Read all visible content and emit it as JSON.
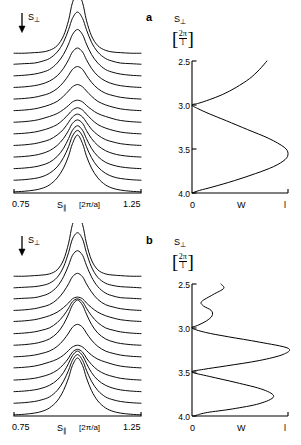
{
  "figure": {
    "background": "#ffffff",
    "line_color": "#000000"
  },
  "panels": [
    {
      "id": "a",
      "tag": "a",
      "left_plot": {
        "x_axis": {
          "label_symbol": "S",
          "label_sub": "∥",
          "unit": "[2π/a]",
          "min_label": "0.75",
          "max_label": "1.25",
          "min": 0.75,
          "max": 1.25
        },
        "stack_arrow_label": "S",
        "stack_arrow_sub": "⊥",
        "stack_arrow_dir": "down"
      },
      "right_plot": {
        "y_axis": {
          "label_symbol": "S",
          "label_sub": "⊥",
          "unit_num": "2π",
          "unit_den": "l",
          "ticks": [
            "2.5",
            "3.0",
            "3.5",
            "4.0"
          ],
          "tick_values": [
            2.5,
            3.0,
            3.5,
            4.0
          ],
          "min": 2.5,
          "max": 4.0,
          "direction": "downward"
        },
        "x_axis": {
          "label": "W",
          "ticks": [
            "0",
            "l"
          ],
          "tick_values": [
            0,
            1
          ],
          "min": 0,
          "max": 1
        }
      }
    },
    {
      "id": "b",
      "tag": "b",
      "left_plot": {
        "x_axis": {
          "label_symbol": "S",
          "label_sub": "∥",
          "unit": "[2π/a]",
          "min_label": "0.75",
          "max_label": "1.25",
          "min": 0.75,
          "max": 1.25
        },
        "stack_arrow_label": "S",
        "stack_arrow_sub": "⊥",
        "stack_arrow_dir": "down"
      },
      "right_plot": {
        "y_axis": {
          "label_symbol": "S",
          "label_sub": "⊥",
          "unit_num": "2π",
          "unit_den": "l",
          "ticks": [
            "2.5",
            "3.0",
            "3.5",
            "4.0"
          ],
          "tick_values": [
            2.5,
            3.0,
            3.5,
            4.0
          ],
          "min": 2.5,
          "max": 4.0,
          "direction": "downward"
        },
        "x_axis": {
          "label": "W",
          "ticks": [
            "0",
            "l"
          ],
          "tick_values": [
            0,
            1
          ],
          "min": 0,
          "max": 1
        }
      }
    }
  ],
  "chart_data": [
    {
      "type": "line",
      "panel": "a",
      "subplot": "left-waterfall",
      "title": "",
      "xlabel": "S∥ [2π/a]",
      "ylabel": "intensity (stacked, offset by S⊥)",
      "xlim": [
        0.75,
        1.25
      ],
      "grid": false,
      "legend": "none",
      "n_curves": 13,
      "description": "Stacked (waterfall) set of single-peaked scattering profiles, each offset vertically; S⊥ increases downward as indicated by the arrow.",
      "x": [
        0.75,
        0.79,
        0.83,
        0.86,
        0.89,
        0.92,
        0.945,
        0.965,
        0.98,
        1.0,
        1.02,
        1.035,
        1.055,
        1.08,
        1.11,
        1.14,
        1.17,
        1.21,
        1.25
      ],
      "series": [
        {
          "name": "curve-1",
          "offset": 0,
          "peak_height": 1.0,
          "values": [
            0.02,
            0.03,
            0.05,
            0.08,
            0.14,
            0.26,
            0.43,
            0.64,
            0.85,
            1.0,
            0.85,
            0.64,
            0.43,
            0.26,
            0.14,
            0.08,
            0.05,
            0.03,
            0.02
          ]
        },
        {
          "name": "curve-2",
          "offset": 1,
          "peak_height": 0.88,
          "values": [
            0.02,
            0.03,
            0.05,
            0.08,
            0.14,
            0.25,
            0.41,
            0.6,
            0.78,
            0.88,
            0.78,
            0.6,
            0.41,
            0.25,
            0.14,
            0.08,
            0.05,
            0.03,
            0.02
          ]
        },
        {
          "name": "curve-3",
          "offset": 2,
          "peak_height": 0.76,
          "values": [
            0.02,
            0.03,
            0.05,
            0.08,
            0.13,
            0.23,
            0.37,
            0.54,
            0.68,
            0.76,
            0.68,
            0.54,
            0.37,
            0.23,
            0.13,
            0.08,
            0.05,
            0.03,
            0.02
          ]
        },
        {
          "name": "curve-4",
          "offset": 3,
          "peak_height": 0.66,
          "values": [
            0.02,
            0.03,
            0.05,
            0.08,
            0.13,
            0.22,
            0.34,
            0.48,
            0.6,
            0.66,
            0.6,
            0.48,
            0.34,
            0.22,
            0.13,
            0.08,
            0.05,
            0.03,
            0.02
          ]
        },
        {
          "name": "curve-5",
          "offset": 4,
          "peak_height": 0.56,
          "values": [
            0.02,
            0.03,
            0.05,
            0.08,
            0.12,
            0.2,
            0.3,
            0.42,
            0.51,
            0.56,
            0.51,
            0.42,
            0.3,
            0.2,
            0.12,
            0.08,
            0.05,
            0.03,
            0.02
          ]
        },
        {
          "name": "curve-6",
          "offset": 5,
          "peak_height": 0.47,
          "values": [
            0.02,
            0.03,
            0.05,
            0.08,
            0.12,
            0.18,
            0.27,
            0.36,
            0.43,
            0.47,
            0.43,
            0.36,
            0.27,
            0.18,
            0.12,
            0.08,
            0.05,
            0.03,
            0.02
          ]
        },
        {
          "name": "curve-7",
          "offset": 6,
          "peak_height": 0.4,
          "values": [
            0.02,
            0.03,
            0.05,
            0.08,
            0.12,
            0.17,
            0.24,
            0.31,
            0.37,
            0.4,
            0.37,
            0.31,
            0.24,
            0.17,
            0.12,
            0.08,
            0.05,
            0.03,
            0.02
          ]
        },
        {
          "name": "curve-8",
          "offset": 7,
          "peak_height": 0.47,
          "values": [
            0.02,
            0.03,
            0.05,
            0.08,
            0.12,
            0.18,
            0.27,
            0.36,
            0.43,
            0.47,
            0.43,
            0.36,
            0.27,
            0.18,
            0.12,
            0.08,
            0.05,
            0.03,
            0.02
          ]
        },
        {
          "name": "curve-9",
          "offset": 8,
          "peak_height": 0.58,
          "values": [
            0.02,
            0.03,
            0.05,
            0.08,
            0.12,
            0.2,
            0.31,
            0.43,
            0.53,
            0.58,
            0.53,
            0.43,
            0.31,
            0.2,
            0.12,
            0.08,
            0.05,
            0.03,
            0.02
          ]
        },
        {
          "name": "curve-10",
          "offset": 9,
          "peak_height": 0.7,
          "values": [
            0.02,
            0.03,
            0.05,
            0.08,
            0.13,
            0.22,
            0.35,
            0.5,
            0.63,
            0.7,
            0.63,
            0.5,
            0.35,
            0.22,
            0.13,
            0.08,
            0.05,
            0.03,
            0.02
          ]
        },
        {
          "name": "curve-11",
          "offset": 10,
          "peak_height": 0.82,
          "values": [
            0.02,
            0.03,
            0.05,
            0.08,
            0.13,
            0.24,
            0.39,
            0.57,
            0.73,
            0.82,
            0.73,
            0.57,
            0.39,
            0.24,
            0.13,
            0.08,
            0.05,
            0.03,
            0.02
          ]
        },
        {
          "name": "curve-12",
          "offset": 11,
          "peak_height": 0.92,
          "values": [
            0.02,
            0.03,
            0.04,
            0.07,
            0.12,
            0.23,
            0.4,
            0.62,
            0.81,
            0.92,
            0.81,
            0.62,
            0.4,
            0.23,
            0.12,
            0.07,
            0.04,
            0.03,
            0.02
          ]
        },
        {
          "name": "curve-13",
          "offset": 12,
          "peak_height": 1.05,
          "values": [
            0.01,
            0.01,
            0.02,
            0.03,
            0.06,
            0.14,
            0.31,
            0.58,
            0.88,
            1.05,
            0.88,
            0.58,
            0.31,
            0.14,
            0.06,
            0.03,
            0.02,
            0.01,
            0.01
          ]
        }
      ]
    },
    {
      "type": "line",
      "panel": "a",
      "subplot": "right-W",
      "title": "",
      "xlabel": "W",
      "ylabel": "S⊥ [2π/l]",
      "xlim": [
        0,
        1
      ],
      "ylim": [
        2.5,
        4.0
      ],
      "y_inverted": true,
      "grid": false,
      "legend": "none",
      "description": "Single continuous W(S⊥) curve: enters at top right near W≈0.78 at S⊥=2.5, decreases to W=0 at S⊥=3.0, rises to a broad maximum W≈1.0 near S⊥=3.55, then falls back to W=0 at S⊥=4.0.",
      "y": [
        2.5,
        2.6,
        2.7,
        2.8,
        2.88,
        2.94,
        2.98,
        3.0,
        3.04,
        3.1,
        3.18,
        3.28,
        3.38,
        3.48,
        3.55,
        3.62,
        3.7,
        3.78,
        3.86,
        3.93,
        3.97,
        4.0
      ],
      "values": [
        0.78,
        0.7,
        0.6,
        0.46,
        0.32,
        0.18,
        0.07,
        0.0,
        0.06,
        0.18,
        0.36,
        0.58,
        0.8,
        0.96,
        1.0,
        0.97,
        0.85,
        0.66,
        0.44,
        0.22,
        0.08,
        0.0
      ]
    },
    {
      "type": "line",
      "panel": "b",
      "subplot": "left-waterfall",
      "title": "",
      "xlabel": "S∥ [2π/a]",
      "ylabel": "intensity (stacked, offset by S⊥)",
      "xlim": [
        0.75,
        1.25
      ],
      "grid": false,
      "legend": "none",
      "n_curves": 13,
      "description": "Stacked waterfall of peaks with modulated heights: large peak at top, dip, second maximum in the middle, dip, third maximum near the bottom.",
      "x": [
        0.75,
        0.79,
        0.83,
        0.86,
        0.89,
        0.92,
        0.945,
        0.965,
        0.98,
        1.0,
        1.02,
        1.035,
        1.055,
        1.08,
        1.11,
        1.14,
        1.17,
        1.21,
        1.25
      ],
      "series": [
        {
          "name": "curve-1",
          "offset": 0,
          "peak_height": 1.0,
          "values": [
            0.02,
            0.03,
            0.05,
            0.08,
            0.14,
            0.26,
            0.44,
            0.66,
            0.87,
            1.0,
            0.87,
            0.66,
            0.44,
            0.26,
            0.14,
            0.08,
            0.05,
            0.03,
            0.02
          ]
        },
        {
          "name": "curve-2",
          "offset": 1,
          "peak_height": 0.86,
          "values": [
            0.02,
            0.03,
            0.05,
            0.08,
            0.13,
            0.24,
            0.4,
            0.59,
            0.76,
            0.86,
            0.76,
            0.59,
            0.4,
            0.24,
            0.13,
            0.08,
            0.05,
            0.03,
            0.02
          ]
        },
        {
          "name": "curve-3",
          "offset": 2,
          "peak_height": 0.72,
          "values": [
            0.02,
            0.03,
            0.05,
            0.08,
            0.13,
            0.22,
            0.35,
            0.51,
            0.64,
            0.72,
            0.64,
            0.51,
            0.35,
            0.22,
            0.13,
            0.08,
            0.05,
            0.03,
            0.02
          ]
        },
        {
          "name": "curve-4",
          "offset": 3,
          "peak_height": 0.55,
          "values": [
            0.02,
            0.03,
            0.05,
            0.08,
            0.12,
            0.19,
            0.29,
            0.4,
            0.5,
            0.55,
            0.5,
            0.4,
            0.29,
            0.19,
            0.12,
            0.08,
            0.05,
            0.03,
            0.02
          ]
        },
        {
          "name": "curve-5",
          "offset": 4,
          "peak_height": 0.42,
          "values": [
            0.03,
            0.04,
            0.06,
            0.09,
            0.13,
            0.18,
            0.25,
            0.33,
            0.39,
            0.42,
            0.39,
            0.33,
            0.25,
            0.18,
            0.13,
            0.09,
            0.06,
            0.04,
            0.03
          ]
        },
        {
          "name": "curve-6",
          "offset": 5,
          "peak_height": 0.58,
          "values": [
            0.02,
            0.03,
            0.05,
            0.08,
            0.12,
            0.2,
            0.31,
            0.43,
            0.53,
            0.58,
            0.53,
            0.43,
            0.31,
            0.2,
            0.12,
            0.08,
            0.05,
            0.03,
            0.02
          ]
        },
        {
          "name": "curve-7",
          "offset": 6,
          "peak_height": 0.8,
          "values": [
            0.02,
            0.03,
            0.05,
            0.08,
            0.13,
            0.23,
            0.38,
            0.56,
            0.71,
            0.8,
            0.71,
            0.56,
            0.38,
            0.23,
            0.13,
            0.08,
            0.05,
            0.03,
            0.02
          ]
        },
        {
          "name": "curve-8",
          "offset": 7,
          "peak_height": 0.62,
          "values": [
            0.02,
            0.03,
            0.05,
            0.08,
            0.12,
            0.21,
            0.33,
            0.46,
            0.57,
            0.62,
            0.57,
            0.46,
            0.33,
            0.21,
            0.12,
            0.08,
            0.05,
            0.03,
            0.02
          ]
        },
        {
          "name": "curve-9",
          "offset": 8,
          "peak_height": 0.45,
          "values": [
            0.03,
            0.04,
            0.06,
            0.09,
            0.13,
            0.19,
            0.27,
            0.35,
            0.42,
            0.45,
            0.42,
            0.35,
            0.27,
            0.19,
            0.13,
            0.09,
            0.06,
            0.04,
            0.03
          ]
        },
        {
          "name": "curve-10",
          "offset": 9,
          "peak_height": 0.66,
          "values": [
            0.02,
            0.03,
            0.05,
            0.08,
            0.12,
            0.21,
            0.34,
            0.48,
            0.6,
            0.66,
            0.6,
            0.48,
            0.34,
            0.21,
            0.12,
            0.08,
            0.05,
            0.03,
            0.02
          ]
        },
        {
          "name": "curve-11",
          "offset": 10,
          "peak_height": 0.85,
          "values": [
            0.02,
            0.03,
            0.04,
            0.07,
            0.12,
            0.23,
            0.4,
            0.6,
            0.77,
            0.85,
            0.77,
            0.6,
            0.4,
            0.23,
            0.12,
            0.07,
            0.04,
            0.03,
            0.02
          ]
        },
        {
          "name": "curve-12",
          "offset": 11,
          "peak_height": 0.96,
          "values": [
            0.01,
            0.02,
            0.03,
            0.05,
            0.09,
            0.19,
            0.37,
            0.62,
            0.85,
            0.96,
            0.85,
            0.62,
            0.37,
            0.19,
            0.09,
            0.05,
            0.03,
            0.02,
            0.01
          ]
        },
        {
          "name": "curve-13",
          "offset": 12,
          "peak_height": 1.08,
          "values": [
            0.01,
            0.01,
            0.02,
            0.03,
            0.05,
            0.12,
            0.29,
            0.58,
            0.9,
            1.08,
            0.9,
            0.58,
            0.29,
            0.12,
            0.05,
            0.03,
            0.02,
            0.01,
            0.01
          ]
        }
      ]
    },
    {
      "type": "line",
      "panel": "b",
      "subplot": "right-W",
      "title": "",
      "xlabel": "W",
      "ylabel": "S⊥ [2π/l]",
      "xlim": [
        0,
        1
      ],
      "ylim": [
        2.5,
        4.0
      ],
      "y_inverted": true,
      "grid": false,
      "legend": "none",
      "description": "W(S⊥) curve with three lobes: small shoulder peaking W≈0.33 near S⊥=2.55 with a secondary wiggle (local min W≈0.10 at 2.70, local max W≈0.22 at 2.78), zero at S⊥=3.0, dominant peak W≈1.0 at S⊥≈3.23, zero at S⊥=3.5, third peak W≈0.85 at S⊥≈3.78, returning to near zero at S⊥=4.0.",
      "y": [
        2.5,
        2.55,
        2.62,
        2.7,
        2.75,
        2.8,
        2.86,
        2.92,
        2.97,
        3.0,
        3.05,
        3.1,
        3.16,
        3.23,
        3.3,
        3.37,
        3.43,
        3.47,
        3.5,
        3.55,
        3.62,
        3.7,
        3.78,
        3.86,
        3.92,
        3.96,
        3.99,
        4.0
      ],
      "values": [
        0.3,
        0.33,
        0.22,
        0.1,
        0.12,
        0.2,
        0.21,
        0.15,
        0.06,
        0.0,
        0.14,
        0.38,
        0.7,
        1.0,
        0.95,
        0.7,
        0.36,
        0.12,
        0.0,
        0.18,
        0.46,
        0.74,
        0.85,
        0.7,
        0.42,
        0.16,
        0.05,
        0.03
      ]
    }
  ]
}
